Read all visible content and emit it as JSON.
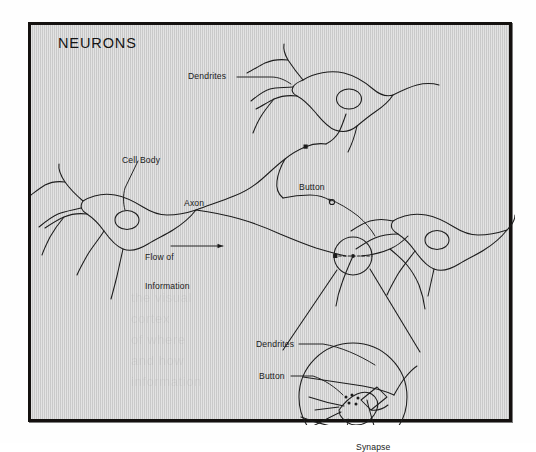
{
  "figure": {
    "title": "NEURONS",
    "background_color": "#d4d4d4",
    "frame_color": "#14110f",
    "ink_color": "#1a1a1a"
  },
  "labels": {
    "dendrites_top": "Dendrites",
    "cell_body": "Cell Body",
    "axon": "Axon",
    "button_main": "Button",
    "flow_line1": "Flow of",
    "flow_line2": "Information",
    "dendrites_inset": "Dendrites",
    "button_inset": "Button",
    "synapse_inset": "Synapse"
  },
  "bleed_through": {
    "line1": "the visual",
    "line2": "cortex",
    "line3": "of where",
    "line4": "and how",
    "line5": "information"
  },
  "diagram_elements": {
    "neurons": [
      {
        "name": "top-right-neuron",
        "has_nucleus": true
      },
      {
        "name": "left-neuron",
        "has_nucleus": true
      },
      {
        "name": "right-neuron",
        "has_nucleus": true
      }
    ],
    "terminal_buttons": 3,
    "magnifier_circle_on_axon": true,
    "magnified_inset_circle": true,
    "synaptic_vesicles": 5
  }
}
